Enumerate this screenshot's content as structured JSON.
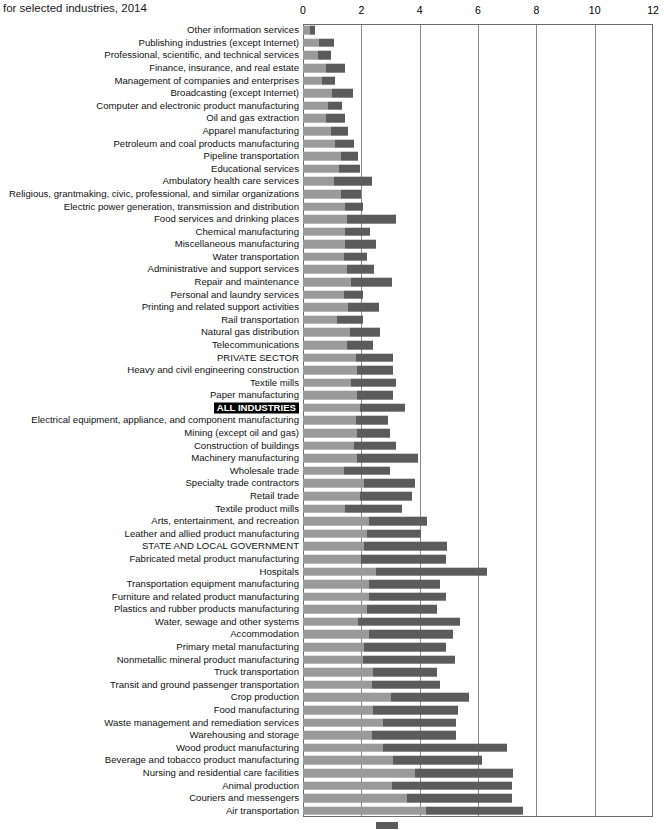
{
  "title": {
    "subtitle": "for selected industries, 2014"
  },
  "axis": {
    "ticks": [
      0,
      2,
      4,
      6,
      8,
      10,
      12
    ],
    "xmin": 0,
    "xmax": 12,
    "gridlines": [
      2,
      4,
      6,
      8,
      10
    ]
  },
  "colors": {
    "segment_a": "#9a9a9a",
    "segment_b": "#5b5b5b",
    "frame": "#6b6b6b",
    "gridline": "#8a8a8a",
    "highlight_bg": "#000000",
    "highlight_fg": "#ffffff"
  },
  "legend": {
    "swatch_color": "#5b5b5b"
  },
  "chart_data": {
    "type": "bar",
    "orientation": "horizontal",
    "stacked": true,
    "title": "for selected industries, 2014",
    "xlabel": "",
    "ylabel": "",
    "xlim": [
      0,
      12
    ],
    "grid": true,
    "legend_position": "bottom",
    "series": [
      {
        "name": "segment-a",
        "color": "#9a9a9a"
      },
      {
        "name": "segment-b",
        "color": "#5b5b5b"
      }
    ],
    "categories": [
      "Other information services",
      "Publishing industries (except Internet)",
      "Professional, scientific, and technical services",
      "Finance, insurance, and real estate",
      "Management of companies and enterprises",
      "Broadcasting (except Internet)",
      "Computer and electronic product manufacturing",
      "Oil and gas extraction",
      "Apparel manufacturing",
      "Petroleum and coal products manufacturing",
      "Pipeline transportation",
      "Educational services",
      "Ambulatory health care services",
      "Religious, grantmaking, civic, professional, and similar organizations",
      "Electric power generation, transmission and distribution",
      "Food services and drinking places",
      "Chemical manufacturing",
      "Miscellaneous manufacturing",
      "Water transportation",
      "Administrative and support services",
      "Repair and maintenance",
      "Personal and laundry services",
      "Printing and related support activities",
      "Rail transportation",
      "Natural gas distribution",
      "Telecommunications",
      "PRIVATE SECTOR",
      "Heavy and civil engineering construction",
      "Textile mills",
      "Paper manufacturing",
      "ALL INDUSTRIES",
      "Electrical equipment, appliance, and component manufacturing",
      "Mining (except oil and gas)",
      "Construction of buildings",
      "Machinery manufacturing",
      "Wholesale trade",
      "Specialty trade contractors",
      "Retail trade",
      "Textile product mills",
      "Arts, entertainment, and recreation",
      "Leather and allied product manufacturing",
      "STATE AND LOCAL GOVERNMENT",
      "Fabricated metal product manufacturing",
      "Hospitals",
      "Transportation equipment manufacturing",
      "Furniture and related product manufacturing",
      "Plastics and rubber products manufacturing",
      "Water, sewage and other systems",
      "Accommodation",
      "Primary metal manufacturing",
      "Nonmetallic mineral product manufacturing",
      "Truck transportation",
      "Transit and ground passenger transportation",
      "Crop production",
      "Food manufacturing",
      "Waste management and remediation services",
      "Warehousing and storage",
      "Wood product manufacturing",
      "Beverage and tobacco product manufacturing",
      "Nursing and residential care facilities",
      "Animal production",
      "Couriers and messengers",
      "Air transportation"
    ],
    "highlight_categories": [
      "ALL INDUSTRIES"
    ],
    "values_a": [
      0.25,
      0.55,
      0.5,
      0.8,
      0.65,
      1.0,
      0.85,
      0.8,
      0.95,
      1.1,
      1.3,
      1.25,
      1.05,
      1.3,
      1.45,
      1.5,
      1.45,
      1.45,
      1.4,
      1.5,
      1.65,
      1.4,
      1.55,
      1.15,
      1.6,
      1.5,
      1.8,
      1.85,
      1.65,
      1.85,
      1.95,
      1.8,
      1.85,
      1.75,
      1.85,
      1.4,
      2.1,
      1.95,
      1.45,
      2.25,
      2.2,
      2.1,
      2.0,
      2.5,
      2.25,
      2.25,
      2.2,
      1.9,
      2.25,
      2.1,
      2.05,
      2.4,
      2.35,
      3.0,
      2.4,
      2.75,
      2.35,
      2.75,
      3.1,
      3.85,
      3.05,
      3.55,
      4.2
    ],
    "values_b": [
      0.15,
      0.5,
      0.45,
      0.65,
      0.45,
      0.7,
      0.5,
      0.65,
      0.6,
      0.65,
      0.6,
      0.7,
      1.3,
      0.7,
      0.6,
      1.7,
      0.85,
      1.05,
      0.8,
      0.95,
      1.4,
      0.65,
      1.05,
      0.9,
      1.05,
      0.9,
      1.3,
      1.25,
      1.55,
      1.25,
      1.55,
      1.1,
      1.15,
      1.45,
      2.1,
      1.6,
      1.75,
      1.8,
      1.95,
      2.0,
      1.85,
      2.85,
      2.9,
      3.8,
      2.45,
      2.65,
      2.4,
      3.5,
      2.9,
      2.8,
      3.15,
      2.2,
      2.35,
      2.7,
      2.9,
      2.5,
      2.9,
      4.25,
      3.05,
      3.35,
      4.1,
      3.6,
      3.35
    ]
  }
}
